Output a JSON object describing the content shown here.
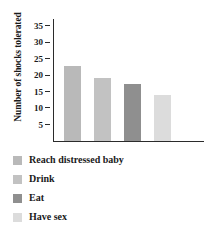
{
  "chart_data": {
    "type": "bar",
    "title": "",
    "xlabel": "",
    "ylabel": "Number of shocks tolerated",
    "categories": [
      "Reach distressed baby",
      "Drink",
      "Eat",
      "Have sex"
    ],
    "values": [
      22.8,
      19.1,
      17.4,
      14.1
    ],
    "colors": [
      "#b9b9b9",
      "#c2c2c2",
      "#8f8f8f",
      "#dcdcdc"
    ],
    "ylim": [
      0,
      37
    ],
    "yticks": [
      5,
      10,
      15,
      20,
      25,
      30,
      35
    ],
    "ytick_labels": [
      "5",
      "10",
      "15",
      "20",
      "25",
      "30",
      "35"
    ],
    "grid": false,
    "legend_position": "below"
  },
  "axis": {
    "label": "Number of shocks tolerated",
    "ticks": [
      {
        "label": "35",
        "value": 35
      },
      {
        "label": "30",
        "value": 30
      },
      {
        "label": "25",
        "value": 25
      },
      {
        "label": "20",
        "value": 20
      },
      {
        "label": "15",
        "value": 15
      },
      {
        "label": "10",
        "value": 10
      },
      {
        "label": "5",
        "value": 5
      }
    ]
  },
  "legend": {
    "items": [
      {
        "label": "Reach distressed baby",
        "color": "#b9b9b9"
      },
      {
        "label": "Drink",
        "color": "#c2c2c2"
      },
      {
        "label": "Eat",
        "color": "#8f8f8f"
      },
      {
        "label": "Have sex",
        "color": "#dcdcdc"
      }
    ]
  }
}
